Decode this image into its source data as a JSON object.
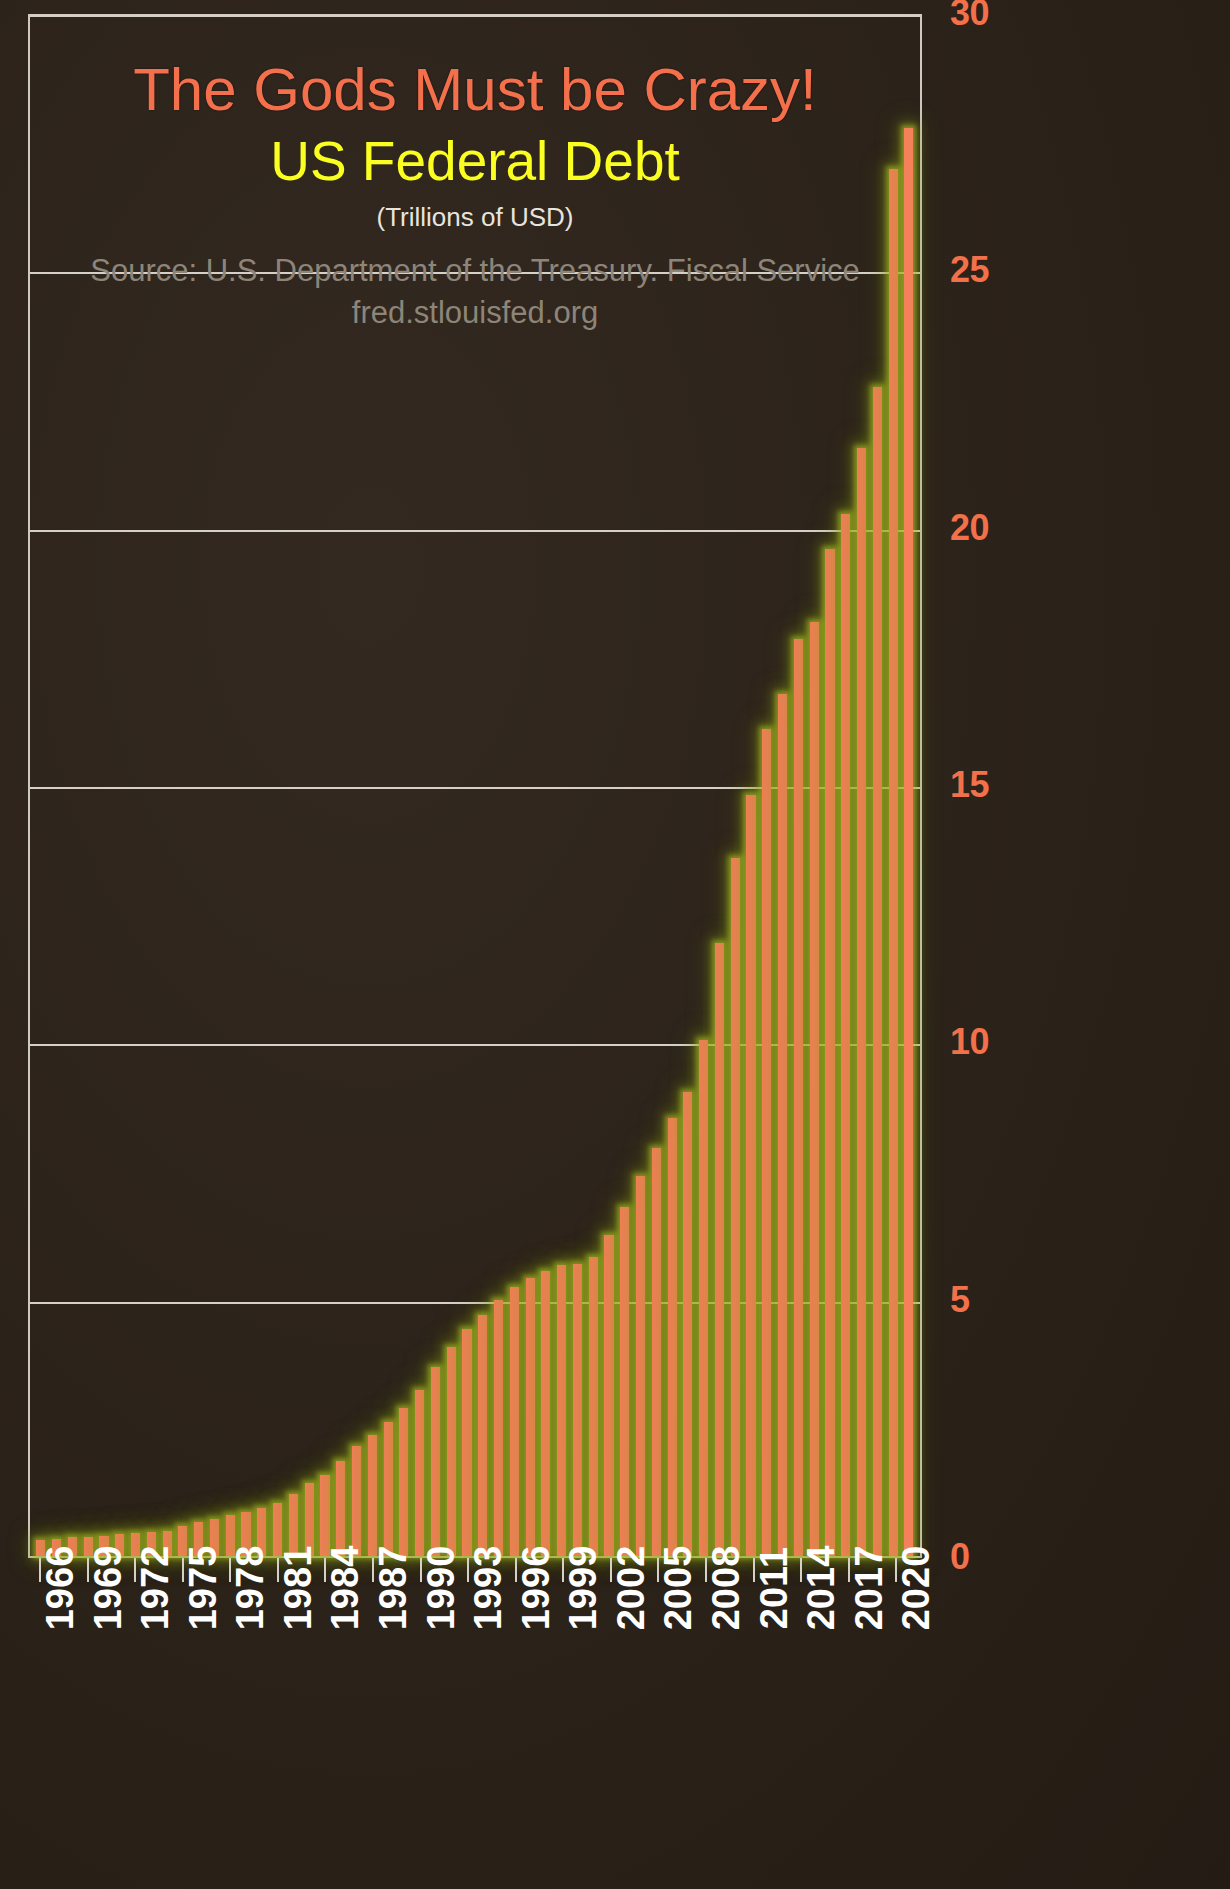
{
  "chart_data": {
    "type": "bar",
    "title": "The Gods Must be Crazy!",
    "subtitle": "US Federal Debt",
    "units": "(Trillions of USD)",
    "source_line_1": "Source: U.S. Department of the Treasury. Fiscal Service",
    "source_line_2": "fred.stlouisfed.org",
    "xlabel": "",
    "ylabel": "Trillions of USD",
    "ylim": [
      0,
      30
    ],
    "yticks": [
      0,
      5,
      10,
      15,
      20,
      25,
      30
    ],
    "ytick_labels": [
      "0",
      "5",
      "10",
      "15",
      "20",
      "25",
      "30"
    ],
    "grid": true,
    "legend": "none",
    "xtick_labels": [
      "1966",
      "1969",
      "1972",
      "1975",
      "1978",
      "1981",
      "1984",
      "1987",
      "1990",
      "1993",
      "1996",
      "1999",
      "2002",
      "2005",
      "2008",
      "2011",
      "2014",
      "2017",
      "2020"
    ],
    "xtick_step_years": 3,
    "categories": [
      "1966",
      "1967",
      "1968",
      "1969",
      "1970",
      "1971",
      "1972",
      "1973",
      "1974",
      "1975",
      "1976",
      "1977",
      "1978",
      "1979",
      "1980",
      "1981",
      "1982",
      "1983",
      "1984",
      "1985",
      "1986",
      "1987",
      "1988",
      "1989",
      "1990",
      "1991",
      "1992",
      "1993",
      "1994",
      "1995",
      "1996",
      "1997",
      "1998",
      "1999",
      "2000",
      "2001",
      "2002",
      "2003",
      "2004",
      "2005",
      "2006",
      "2007",
      "2008",
      "2009",
      "2010",
      "2011",
      "2012",
      "2013",
      "2014",
      "2015",
      "2016",
      "2017",
      "2018",
      "2019",
      "2020",
      "2021"
    ],
    "values": [
      0.32,
      0.34,
      0.37,
      0.37,
      0.39,
      0.42,
      0.45,
      0.47,
      0.49,
      0.58,
      0.66,
      0.72,
      0.79,
      0.85,
      0.93,
      1.03,
      1.2,
      1.41,
      1.58,
      1.85,
      2.13,
      2.35,
      2.6,
      2.87,
      3.23,
      3.67,
      4.07,
      4.41,
      4.69,
      4.97,
      5.22,
      5.41,
      5.53,
      5.66,
      5.67,
      5.81,
      6.23,
      6.78,
      7.38,
      7.93,
      8.51,
      9.01,
      10.02,
      11.91,
      13.56,
      14.79,
      16.07,
      16.74,
      17.82,
      18.15,
      19.57,
      20.24,
      21.52,
      22.72,
      26.95,
      27.75
    ]
  },
  "axis": {
    "y_tick_30": "30",
    "y_tick_25": "25",
    "y_tick_20": "20",
    "y_tick_15": "15",
    "y_tick_10": "10",
    "y_tick_5": "5",
    "y_tick_0": "0"
  },
  "colors": {
    "bar": "#f5815a",
    "bar_glow": "#b4c828",
    "title": "#f4704c",
    "subtitle": "#faff21",
    "units_text": "#e8e4dd",
    "source_text": "#8d8579",
    "axis_tick": "#f2714a",
    "xtick_text": "#ffffff",
    "gridline": "#d6d1c8",
    "background": "#2b2219"
  }
}
